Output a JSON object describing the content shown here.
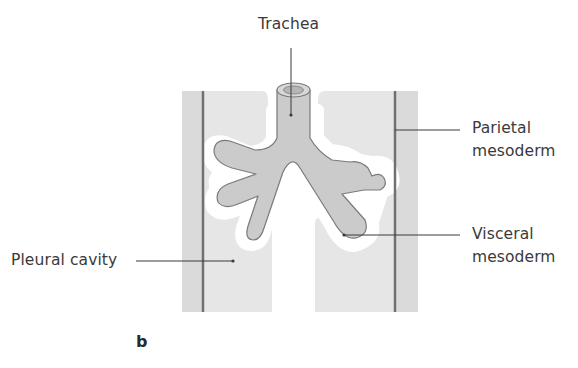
{
  "figure": {
    "panel_letter": "b",
    "labels": {
      "trachea": "Trachea",
      "parietal_line1": "Parietal",
      "parietal_line2": "mesoderm",
      "visceral_line1": "Visceral",
      "visceral_line2": "mesoderm",
      "pleural_cavity": "Pleural cavity"
    },
    "colors": {
      "mesoderm_fill": "#e4e4e4",
      "outer_band": "#d8d8d8",
      "bronchus_fill": "#c9c9c9",
      "bronchus_outline": "#7a7a7a",
      "parietal_line": "#6f6f6f",
      "leader_line": "#3a3a3a"
    }
  }
}
